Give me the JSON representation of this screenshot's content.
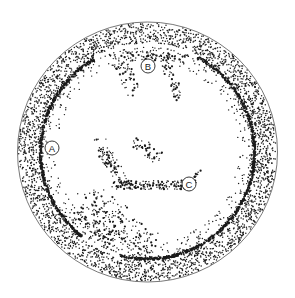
{
  "figure": {
    "type": "stippled illustration",
    "colors": {
      "background": "#ffffff",
      "ink": "#1a1a1a",
      "outline": "#555555"
    },
    "dish": {
      "cx": 147.5,
      "cy": 152,
      "outer_r": 130,
      "inner_ring_r": 107
    },
    "labels": [
      {
        "id": "A",
        "text": "A",
        "x": 52,
        "y": 148,
        "r": 7
      },
      {
        "id": "B",
        "text": "B",
        "x": 148,
        "y": 66,
        "r": 7
      },
      {
        "id": "C",
        "text": "C",
        "x": 189,
        "y": 184,
        "r": 7
      }
    ]
  }
}
